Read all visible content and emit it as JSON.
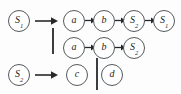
{
  "diagram": {
    "background_color": "#fdfdfd",
    "node_stroke_color": "#55595c",
    "node_fill_color": "#ffffff",
    "text_color": "#1d1f21",
    "arrow_color": "#26292b",
    "bar_color": "#3b3e40"
  },
  "nodes": {
    "lhs_row1": {
      "base": "S",
      "sub": "1",
      "label": "S1"
    },
    "lhs_row3": {
      "base": "S",
      "sub": "2",
      "label": "S2"
    },
    "r1c1": {
      "base": "a",
      "sub": "",
      "label": "a"
    },
    "r1c2": {
      "base": "b",
      "sub": "",
      "label": "b"
    },
    "r1c3": {
      "base": "S",
      "sub": "2",
      "label": "S2"
    },
    "r1c4": {
      "base": "S",
      "sub": "1",
      "label": "S1"
    },
    "r2c1": {
      "base": "a",
      "sub": "",
      "label": "a"
    },
    "r2c2": {
      "base": "b",
      "sub": "",
      "label": "b"
    },
    "r2c3": {
      "base": "S",
      "sub": "2",
      "label": "S2"
    },
    "r3c1": {
      "base": "c",
      "sub": "",
      "label": "c"
    },
    "r3c2": {
      "base": "d",
      "sub": "",
      "label": "d"
    }
  },
  "productions": [
    {
      "lhs": "S1",
      "alternatives": [
        [
          "a",
          "b",
          "S2",
          "S1"
        ],
        [
          "a",
          "b",
          "S2"
        ]
      ]
    },
    {
      "lhs": "S2",
      "alternatives": [
        [
          "c"
        ],
        [
          "d"
        ]
      ]
    }
  ],
  "separators": {
    "alternation_bar_row12": "|",
    "alternation_bar_row3": "|"
  },
  "arrows": {
    "production_arrow": "→",
    "sequence_arrow": "→"
  }
}
